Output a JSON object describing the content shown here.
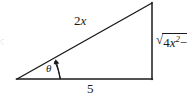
{
  "figure": {
    "type": "right-triangle-diagram",
    "background_color": "#ffffff",
    "line_color": "#1a1a1a",
    "labels": {
      "hypotenuse": "2x",
      "hypotenuse_coefficient": "2",
      "hypotenuse_variable": "x",
      "base": "5",
      "angle": "θ",
      "vertical_prefix": "√",
      "vertical_radicand_coefficient": "4",
      "vertical_radicand_variable": "x",
      "vertical_radicand_exponent": "2",
      "vertical_truncated_operator": "−",
      "vertical_full_visible": "√4x² −"
    },
    "edge_fragment_left": "ः",
    "geometry": {
      "left_vertex": "(17, 79)",
      "bottom_right_vertex": "(152, 79)",
      "top_right_vertex": "(152, 3)",
      "base_length_label": "5",
      "hypotenuse_label": "2x",
      "right_angle_at": "bottom-right"
    }
  }
}
